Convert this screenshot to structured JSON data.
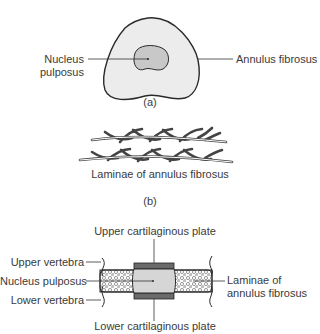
{
  "figure": {
    "panel_a": {
      "caption": "(a)",
      "labels": {
        "nucleus_line1": "Nucleus",
        "nucleus_line2": "pulposus",
        "annulus": "Annulus fibrosus"
      }
    },
    "panel_b": {
      "caption": "(b)",
      "label": "Laminae of annulus fibrosus"
    },
    "panel_c": {
      "labels": {
        "upper_plate": "Upper cartilaginous plate",
        "lower_plate": "Lower cartilaginous plate",
        "upper_vertebra": "Upper vertebra",
        "nucleus": "Nucleus pulposus",
        "lower_vertebra": "Lower vertebra",
        "laminae_line1": "Laminae of",
        "laminae_line2": "annulus fibrosus"
      }
    },
    "colors": {
      "outline": "#2a2a2a",
      "fill_light": "#ececec",
      "fill_nucleus": "#c8c8c8",
      "plate": "#6a6a6a"
    }
  }
}
